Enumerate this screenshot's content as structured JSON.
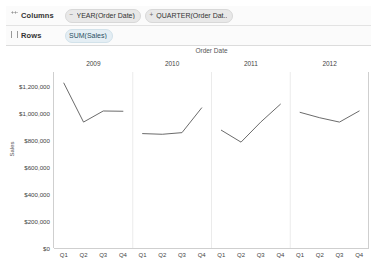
{
  "shelves": {
    "columns": {
      "label": "Columns",
      "grip_icon": "drag-dots-icon",
      "fields": [
        {
          "text": "YEAR(Order Date)",
          "control": "minus-icon",
          "kind": "dim"
        },
        {
          "text": "QUARTER(Order Dat..",
          "control": "plus-icon",
          "kind": "dim"
        }
      ]
    },
    "rows": {
      "label": "Rows",
      "grip_icon": "drag-bars-icon",
      "fields": [
        {
          "text": "SUM(Sales)",
          "control": "",
          "kind": "measure"
        }
      ]
    }
  },
  "chart_data": {
    "type": "line",
    "title": "",
    "xlabel": "Order Date",
    "ylabel": "Sales",
    "ylim": [
      0,
      1300000
    ],
    "grid": false,
    "legend": "none",
    "line_color": "#6b6b6b",
    "ytick_labels": [
      "$1,200,000",
      "$1,000,000",
      "$800,000",
      "$600,000",
      "$400,000",
      "$200,000",
      "$0"
    ],
    "ytick_values": [
      1200000,
      1000000,
      800000,
      600000,
      400000,
      200000,
      0
    ],
    "panels": [
      {
        "year": "2009",
        "categories": [
          "Q1",
          "Q2",
          "Q3",
          "Q4"
        ],
        "values": [
          1218000,
          930000,
          1012000,
          1010000
        ]
      },
      {
        "year": "2010",
        "categories": [
          "Q1",
          "Q2",
          "Q3",
          "Q4"
        ],
        "values": [
          845000,
          840000,
          852000,
          1035000
        ]
      },
      {
        "year": "2011",
        "categories": [
          "Q1",
          "Q2",
          "Q3",
          "Q4"
        ],
        "values": [
          870000,
          782000,
          930000,
          1062000
        ]
      },
      {
        "year": "2012",
        "categories": [
          "Q1",
          "Q2",
          "Q3",
          "Q4"
        ],
        "values": [
          1002000,
          962000,
          930000,
          1012000
        ]
      }
    ]
  }
}
